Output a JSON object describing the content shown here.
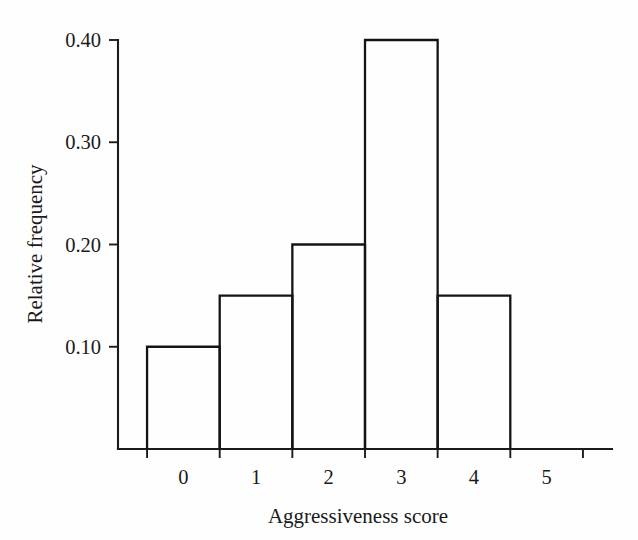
{
  "chart_data": {
    "type": "bar",
    "title": "",
    "subtitle": "",
    "xlabel": "Aggressiveness score",
    "ylabel": "Relative frequency",
    "categories": [
      "0",
      "1",
      "2",
      "3",
      "4",
      "5"
    ],
    "values": [
      0.1,
      0.15,
      0.2,
      0.4,
      0.15,
      0.0
    ],
    "bin_edges": [
      -0.5,
      0.5,
      1.5,
      2.5,
      3.5,
      4.5,
      5.5
    ],
    "bin_width": 1,
    "xlim": [
      -0.9,
      5.9
    ],
    "ylim": [
      0,
      0.42
    ],
    "xticks": [
      -0.5,
      0.5,
      1.5,
      2.5,
      3.5,
      4.5,
      5.5
    ],
    "yticks": [
      0.1,
      0.2,
      0.3,
      0.4
    ],
    "ytick_labels": [
      "0.10",
      "0.20",
      "0.30",
      "0.40"
    ],
    "xtick_labels": [
      "0",
      "1",
      "2",
      "3",
      "4",
      "5"
    ],
    "grid": false,
    "legend": false,
    "legend_position": "none",
    "bar_fill": "none",
    "bar_edge_color": "#141414",
    "axis_color": "#1b1b1b",
    "background_color": "#fefefe",
    "annotations": []
  },
  "axis": {
    "y_title": "Relative frequency",
    "x_title": "Aggressiveness score",
    "y_labels": [
      "0.40",
      "0.30",
      "0.20",
      "0.10"
    ],
    "x_labels": [
      "0",
      "1",
      "2",
      "3",
      "4",
      "5"
    ]
  }
}
